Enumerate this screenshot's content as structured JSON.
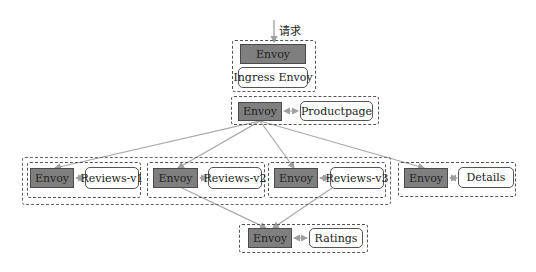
{
  "diagram": {
    "entry_label": "请求",
    "colors": {
      "envoy_fill": "#7f7f7f",
      "edge": "#a8a8a8",
      "border": "#555555"
    },
    "ingress": {
      "envoy": "Envoy",
      "service": "Ingress Envoy"
    },
    "productpage": {
      "envoy": "Envoy",
      "service": "Productpage"
    },
    "reviews_v1": {
      "envoy": "Envoy",
      "service": "Reviews-v1"
    },
    "reviews_v2": {
      "envoy": "Envoy",
      "service": "Reviews-v2"
    },
    "reviews_v3": {
      "envoy": "Envoy",
      "service": "Reviews-v3"
    },
    "details": {
      "envoy": "Envoy",
      "service": "Details"
    },
    "ratings": {
      "envoy": "Envoy",
      "service": "Ratings"
    }
  }
}
